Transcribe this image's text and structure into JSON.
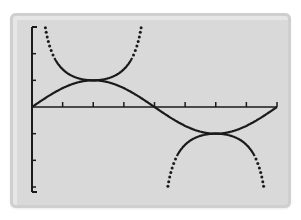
{
  "chart_data": {
    "type": "line",
    "title": "",
    "xlabel": "",
    "ylabel": "",
    "xlim": [
      0,
      6.2832
    ],
    "ylim": [
      -3,
      3
    ],
    "x_tick_step": 0.7854,
    "y_tick_step": 1,
    "grid": false,
    "legend": null,
    "series": [
      {
        "name": "y = sin x",
        "style": "solid",
        "x": [
          0,
          0.7854,
          1.5708,
          2.3562,
          3.1416,
          3.927,
          4.7124,
          5.4978,
          6.2832
        ],
        "values": [
          0,
          0.707,
          1,
          0.707,
          0,
          -0.707,
          -1,
          -0.707,
          0
        ]
      },
      {
        "name": "y = csc x",
        "style": "dotted-near-asymptotes",
        "x": [
          0.34,
          0.7854,
          1.5708,
          2.3562,
          2.8,
          3.48,
          3.927,
          4.7124,
          5.4978,
          5.94
        ],
        "values": [
          3,
          1.414,
          1,
          1.414,
          3,
          -3,
          -1.414,
          -1,
          -1.414,
          -3
        ]
      }
    ]
  },
  "colors": {
    "screen_bg": "#d9d9d9",
    "ink": "#1a1a1a",
    "page_bg": "#ffffff"
  }
}
